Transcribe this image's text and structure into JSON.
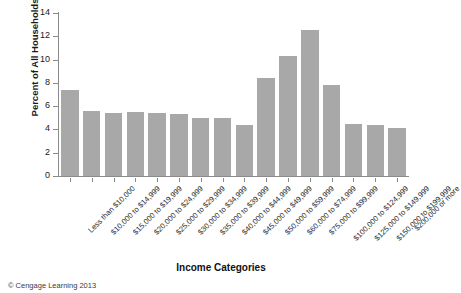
{
  "chart_data": {
    "type": "bar",
    "title": "",
    "xlabel": "Income Categories",
    "ylabel": "Percent of All Households",
    "ylim": [
      0,
      14
    ],
    "yticks": [
      0,
      2,
      4,
      6,
      8,
      10,
      12,
      14
    ],
    "grid": false,
    "legend": null,
    "bar_color": "#a8a8a8",
    "categories": [
      "Less than $10,000",
      "$10,000 to $14,999",
      "$15,000 to $19,999",
      "$20,000 to $24,999",
      "$25,000 to $29,999",
      "$30,000 to $34,999",
      "$35,000 to $39,999",
      "$40,000 to $44,999",
      "$45,000 to $49,999",
      "$50,000 to $59,999",
      "$60,000 to $74,999",
      "$75,000 to $99,999",
      "$100,000 to $124,999",
      "$125,000 to $149,999",
      "$150,000 to $199,999",
      "$200,000 or more"
    ],
    "values": [
      7.4,
      5.6,
      5.4,
      5.5,
      5.4,
      5.3,
      5.0,
      5.0,
      4.4,
      8.4,
      10.3,
      12.5,
      7.8,
      4.5,
      4.4,
      4.1
    ]
  },
  "footer": {
    "credit": "© Cengage Learning 2013"
  }
}
